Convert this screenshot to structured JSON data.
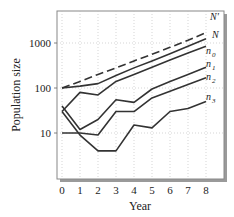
{
  "chart_data": {
    "type": "line",
    "title": "",
    "xlabel": "Year",
    "ylabel": "Population size",
    "x": [
      0,
      1,
      2,
      3,
      4,
      5,
      6,
      7,
      8
    ],
    "xticks": [
      "0",
      "1",
      "2",
      "3",
      "4",
      "5",
      "6",
      "7",
      "8"
    ],
    "yscale": "log",
    "yticks": [
      "10",
      "100",
      "1000"
    ],
    "ylim": [
      2,
      4000
    ],
    "xlim": [
      -0.3,
      8.5
    ],
    "grid": true,
    "series": [
      {
        "name": "N′",
        "style": "dashed",
        "values": [
          100,
          140,
          200,
          280,
          400,
          560,
          800,
          1150,
          1700
        ]
      },
      {
        "name": "N",
        "style": "solid",
        "values": [
          100,
          110,
          125,
          190,
          280,
          400,
          580,
          850,
          1250
        ]
      },
      {
        "name": "n0",
        "style": "solid",
        "values": [
          30,
          80,
          70,
          140,
          200,
          290,
          420,
          600,
          850
        ]
      },
      {
        "name": "n1",
        "style": "solid",
        "values": [
          40,
          12,
          20,
          55,
          48,
          95,
          140,
          200,
          290
        ]
      },
      {
        "name": "n2",
        "style": "solid",
        "values": [
          10,
          10,
          9,
          30,
          30,
          60,
          85,
          120,
          170
        ]
      },
      {
        "name": "n3",
        "style": "solid",
        "values": [
          30,
          9,
          4,
          4,
          15,
          13,
          30,
          35,
          50
        ]
      }
    ]
  },
  "axes": {
    "xlabel": "Year",
    "ylabel": "Population size"
  },
  "labels": {
    "Nprime": "N′",
    "N": "N",
    "n0": "n",
    "n0_sub": "0",
    "n1": "n",
    "n1_sub": "1",
    "n2": "n",
    "n2_sub": "2",
    "n3": "n",
    "n3_sub": "3"
  }
}
